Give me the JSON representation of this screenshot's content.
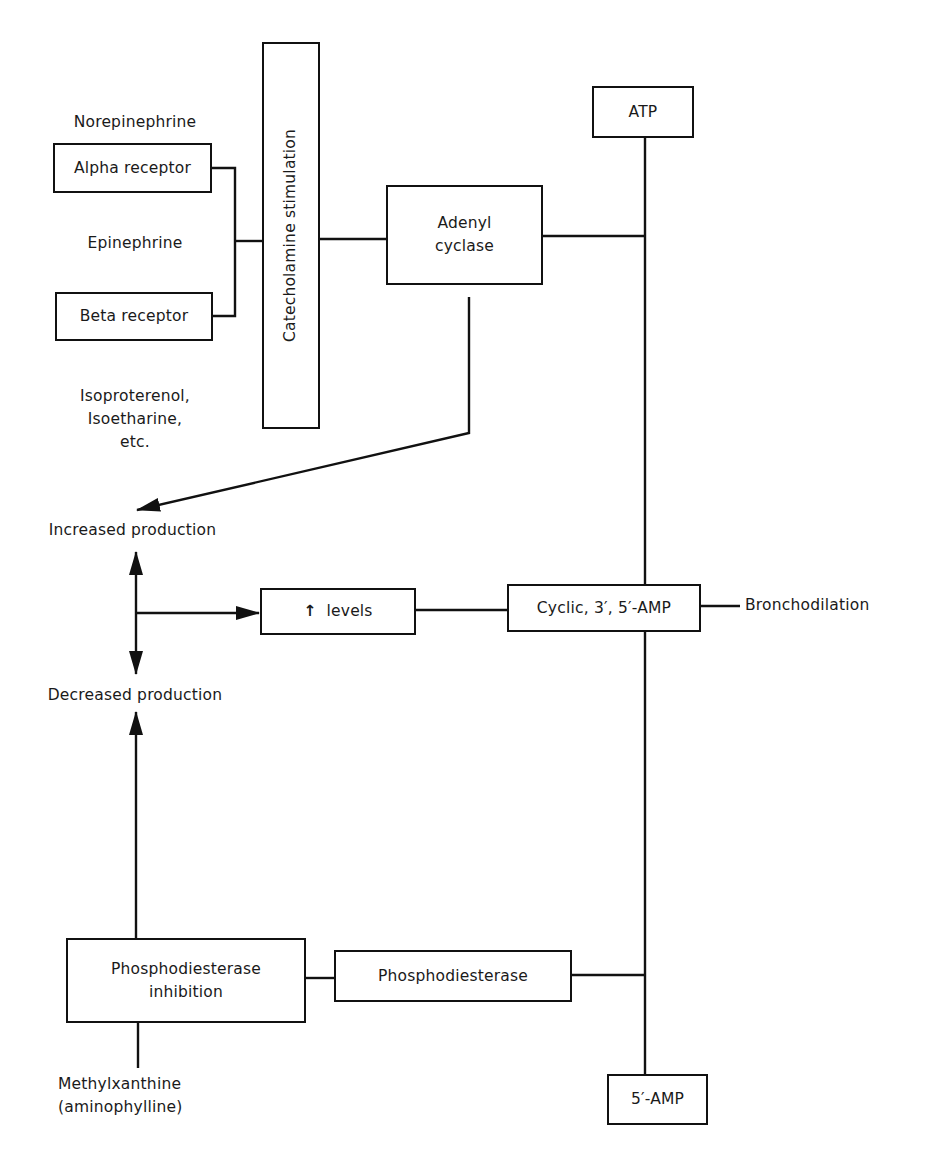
{
  "diagram": {
    "stroke_color": "#111111",
    "background_color": "#ffffff",
    "nodes": {
      "norepinephrine": "Norepinephrine",
      "alpha_receptor": "Alpha receptor",
      "epinephrine": "Epinephrine",
      "beta_receptor": "Beta receptor",
      "isoproterenol_line1": "Isoproterenol,",
      "isoproterenol_line2": "Isoetharine,",
      "isoproterenol_line3": "etc.",
      "catecholamine_stimulation": "Catecholamine stimulation",
      "adenyl_cyclase_line1": "Adenyl",
      "adenyl_cyclase_line2": "cyclase",
      "atp": "ATP",
      "increased_production": "Increased production",
      "decreased_production": "Decreased production",
      "levels_arrow": "↑",
      "levels": "levels",
      "cyclic_amp": "Cyclic, 3′, 5′-AMP",
      "bronchodilation": "Bronchodilation",
      "pde_inhibition_line1": "Phosphodiesterase",
      "pde_inhibition_line2": "inhibition",
      "phosphodiesterase": "Phosphodiesterase",
      "methylxanthine_line1": "Methylxanthine",
      "methylxanthine_line2": "(aminophylline)",
      "five_amp": "5′-AMP"
    },
    "edges": [
      {
        "from": "alpha_receptor",
        "to": "catecholamine_stimulation",
        "type": "line"
      },
      {
        "from": "beta_receptor",
        "to": "catecholamine_stimulation",
        "type": "line"
      },
      {
        "from": "catecholamine_stimulation",
        "to": "adenyl_cyclase",
        "type": "line"
      },
      {
        "from": "adenyl_cyclase",
        "to": "atp_cyclic_amp_axis",
        "type": "line"
      },
      {
        "from": "atp",
        "to": "cyclic_amp",
        "type": "line"
      },
      {
        "from": "adenyl_cyclase",
        "to": "increased_production",
        "type": "arrow"
      },
      {
        "from": "production_junction",
        "to": "increased_production",
        "type": "arrow"
      },
      {
        "from": "production_junction",
        "to": "decreased_production",
        "type": "arrow"
      },
      {
        "from": "production_junction",
        "to": "levels",
        "type": "arrow"
      },
      {
        "from": "levels",
        "to": "cyclic_amp",
        "type": "line"
      },
      {
        "from": "cyclic_amp",
        "to": "bronchodilation",
        "type": "line"
      },
      {
        "from": "cyclic_amp",
        "to": "five_amp",
        "type": "line"
      },
      {
        "from": "pde_inhibition",
        "to": "decreased_production",
        "type": "arrow"
      },
      {
        "from": "pde_inhibition",
        "to": "phosphodiesterase",
        "type": "line"
      },
      {
        "from": "phosphodiesterase",
        "to": "cyclic_amp_five_amp_axis",
        "type": "line"
      },
      {
        "from": "methylxanthine",
        "to": "pde_inhibition",
        "type": "line"
      }
    ]
  }
}
